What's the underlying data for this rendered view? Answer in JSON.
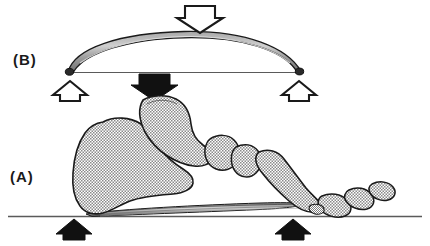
{
  "figure": {
    "width": 430,
    "height": 246,
    "background_color": "#ffffff"
  },
  "panels": [
    {
      "id": "b",
      "label": "(B)",
      "description": "Bow-and-string mechanical analogue of the foot arch",
      "ground_line_y": 72
    },
    {
      "id": "a",
      "label": "(A)",
      "description": "Lateral view of foot skeleton resting on ground with plantar aponeurosis",
      "ground_line_y": 216
    }
  ],
  "colors": {
    "outline": "#1a1a1a",
    "bone_fill": "#d4d4d4",
    "bow_fill": "#b5b5b5",
    "arrow_black": "#111111",
    "arrow_white": "#ffffff",
    "ground_line": "#4a4a4a",
    "label_text": "#1a1a1a"
  },
  "arrows": [
    {
      "name": "load-arrow-bow",
      "style": "outline",
      "direction": "down",
      "panel": "b",
      "meaning": "applied load on bow apex",
      "x": 200,
      "y": 5
    },
    {
      "name": "reaction-arrow-bow-left",
      "style": "outline",
      "direction": "up",
      "panel": "b",
      "meaning": "reaction at left bow end",
      "x": 70,
      "y": 82
    },
    {
      "name": "reaction-arrow-bow-right",
      "style": "outline",
      "direction": "up",
      "panel": "b",
      "meaning": "reaction at right bow end",
      "x": 299,
      "y": 82
    },
    {
      "name": "load-arrow-foot",
      "style": "solid",
      "direction": "down",
      "panel": "a",
      "meaning": "body weight transmitted through talus",
      "x": 154,
      "y": 73
    },
    {
      "name": "reaction-arrow-foot-heel",
      "style": "solid",
      "direction": "up",
      "panel": "a",
      "meaning": "ground reaction at calcaneus",
      "x": 74,
      "y": 219
    },
    {
      "name": "reaction-arrow-foot-forefoot",
      "style": "solid",
      "direction": "up",
      "panel": "a",
      "meaning": "ground reaction at metatarsal heads",
      "x": 293,
      "y": 219
    }
  ],
  "structures": {
    "bow": {
      "name": "elastic-bow",
      "left_end_x": 68,
      "right_end_x": 300,
      "apex_y": 33,
      "chord_y": 72
    },
    "bowstring": {
      "name": "bow-string",
      "from_x": 68,
      "to_x": 300,
      "y": 72
    },
    "bones": [
      "calcaneus",
      "talus",
      "navicular",
      "cuneiform",
      "metatarsal",
      "proximal-phalanx",
      "distal-phalanx"
    ],
    "plantar_aponeurosis": {
      "name": "plantar-aponeurosis",
      "from_x": 85,
      "to_x": 300,
      "y": 210
    }
  }
}
